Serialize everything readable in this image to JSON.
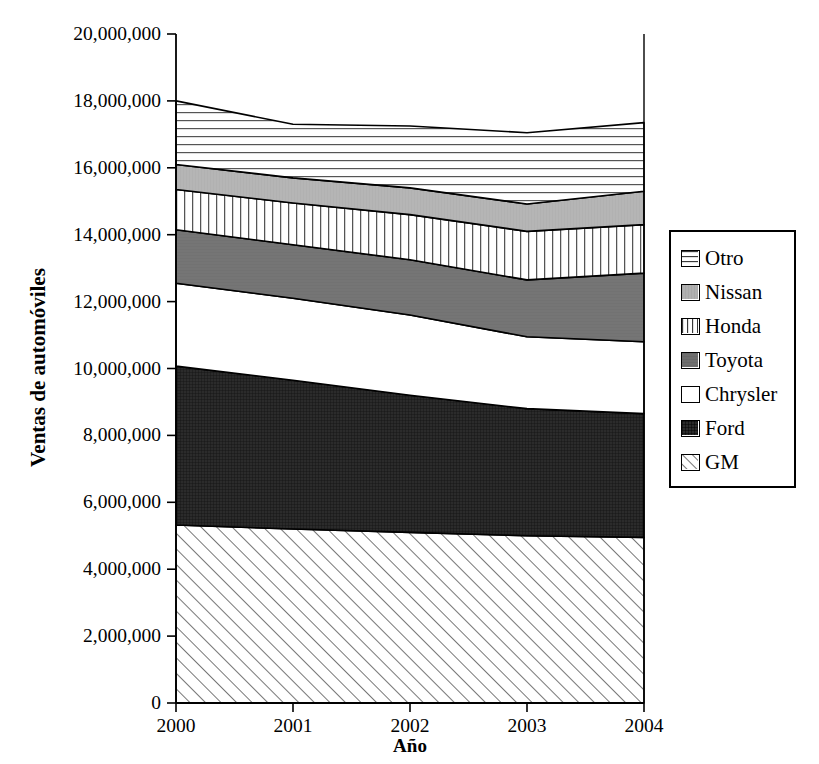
{
  "chart_data": {
    "type": "area",
    "title": "",
    "xlabel": "Año",
    "ylabel": "Ventas de automóviles",
    "x": [
      2000,
      2001,
      2002,
      2003,
      2004
    ],
    "xtick_labels": [
      "2000",
      "2001",
      "2002",
      "2003",
      "2004"
    ],
    "ytick_labels": [
      "0",
      "2,000,000",
      "4,000,000",
      "6,000,000",
      "8,000,000",
      "10,000,000",
      "12,000,000",
      "14,000,000",
      "16,000,000",
      "18,000,000",
      "20,000,000"
    ],
    "ytick_values": [
      0,
      2000000,
      4000000,
      6000000,
      8000000,
      10000000,
      12000000,
      14000000,
      16000000,
      18000000,
      20000000
    ],
    "ylim": [
      0,
      20000000
    ],
    "xlim": [
      2000,
      2004
    ],
    "grid": false,
    "stacked": true,
    "legend_position": "right",
    "series": [
      {
        "name": "GM",
        "values": [
          5320000,
          5200000,
          5100000,
          5000000,
          4950000
        ]
      },
      {
        "name": "Ford",
        "values": [
          4750000,
          4450000,
          4100000,
          3800000,
          3700000
        ]
      },
      {
        "name": "Chrysler",
        "values": [
          2480000,
          2450000,
          2400000,
          2150000,
          2150000
        ]
      },
      {
        "name": "Toyota",
        "values": [
          1600000,
          1600000,
          1650000,
          1700000,
          2050000
        ]
      },
      {
        "name": "Honda",
        "values": [
          1200000,
          1250000,
          1350000,
          1450000,
          1450000
        ]
      },
      {
        "name": "Nissan",
        "values": [
          750000,
          750000,
          800000,
          820000,
          1000000
        ]
      },
      {
        "name": "Otro",
        "values": [
          1900000,
          1600000,
          1850000,
          2130000,
          2050000
        ]
      }
    ],
    "series_totals": [
      18000000,
      17300000,
      17250000,
      17050000,
      17350000
    ],
    "fills": {
      "GM": "diagonal-hatch",
      "Ford": "dark-crosshatch",
      "Chrysler": "white",
      "Toyota": "medium-gray",
      "Honda": "vertical-lines",
      "Nissan": "light-gray",
      "Otro": "horizontal-lines"
    },
    "colors": {
      "GM": "#ffffff",
      "Ford": "#2b2b2b",
      "Chrysler": "#ffffff",
      "Toyota": "#757575",
      "Honda": "#ffffff",
      "Nissan": "#b5b5b5",
      "Otro": "#ffffff",
      "axis": "#000000"
    }
  },
  "legend": {
    "items": [
      {
        "label": "Otro"
      },
      {
        "label": "Nissan"
      },
      {
        "label": "Honda"
      },
      {
        "label": "Toyota"
      },
      {
        "label": "Chrysler"
      },
      {
        "label": "Ford"
      },
      {
        "label": "GM"
      }
    ]
  }
}
